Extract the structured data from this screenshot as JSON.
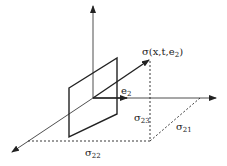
{
  "diagram": {
    "type": "3d-stress-vector",
    "labels": {
      "stress_vector": {
        "main": "σ(x,t,e",
        "sub": "2",
        "close": ")"
      },
      "e2": {
        "main": "e",
        "sub": "2"
      },
      "sigma23": {
        "main": "σ",
        "sub": "23"
      },
      "sigma21": {
        "main": "σ",
        "sub": "21"
      },
      "sigma22": {
        "main": "σ",
        "sub": "22"
      }
    },
    "colors": {
      "line": "#222222",
      "background": "#ffffff"
    }
  }
}
